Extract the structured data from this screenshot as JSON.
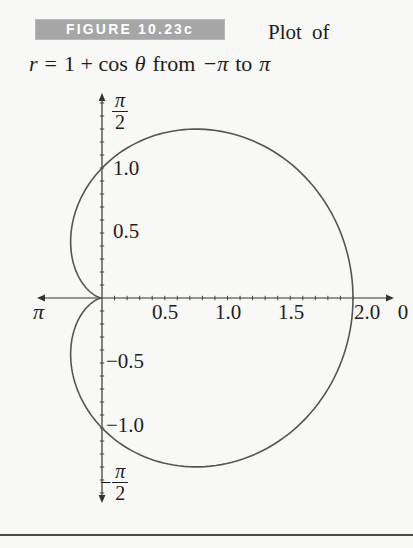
{
  "caption": {
    "badge": "FIGURE 10.23c",
    "after_badge": "Plot of",
    "equation": {
      "lhs": "r",
      "equals": "=",
      "rhs_const": "1 + cos",
      "theta": "θ",
      "word_from": "from",
      "neg_pi": "−π",
      "word_to": "to",
      "pi": "π"
    }
  },
  "plot": {
    "labels": {
      "y_top_num": "π",
      "y_top_den": "2",
      "y_bottom_minus": "−",
      "y_bottom_num": "π",
      "y_bottom_den": "2",
      "x_neg_end": "π",
      "x_pos_end": "0",
      "y_pos_1": "1.0",
      "y_pos_05": "0.5",
      "y_neg_05": "−0.5",
      "y_neg_1": "−1.0",
      "x_05": "0.5",
      "x_1": "1.0",
      "x_15": "1.5",
      "x_2": "2.0"
    },
    "colors": {
      "axis": "#333333",
      "curve": "#555555",
      "text": "#1d1d1d",
      "badge_bg": "#a6a6a6",
      "badge_text": "#ffffff"
    }
  },
  "chart_data": {
    "type": "line",
    "coordinate_system": "polar",
    "title": "Plot of r = 1 + cos θ from −π to π",
    "equation": "r = 1 + cos(θ)",
    "a": 1,
    "b": 1,
    "theta_min": -3.141592653589793,
    "theta_max": 3.141592653589793,
    "x_axis": {
      "labeled_ticks": [
        0.5,
        1.0,
        1.5,
        2.0
      ],
      "minor_tick_step": 0.1,
      "tick_range": [
        0.1,
        2.0
      ],
      "arrow_label_positive": "0",
      "arrow_label_negative": "π"
    },
    "y_axis": {
      "labeled_ticks": [
        -1.0,
        -0.5,
        0.5,
        1.0
      ],
      "minor_tick_step": 0.1,
      "tick_range": [
        -1.5,
        1.5
      ],
      "arrow_label_top": "π/2",
      "arrow_label_bottom": "−π/2"
    },
    "key_points": [
      {
        "theta": 0.0,
        "x": 2.0,
        "y": 0.0
      },
      {
        "theta": 1.0472,
        "x": 0.75,
        "y": 1.299
      },
      {
        "theta": 1.5708,
        "x": 0.0,
        "y": 1.0
      },
      {
        "theta": 2.0944,
        "x": -0.25,
        "y": 0.433
      },
      {
        "theta": 3.1416,
        "x": 0.0,
        "y": 0.0
      },
      {
        "theta": -1.0472,
        "x": 0.75,
        "y": -1.299
      },
      {
        "theta": -1.5708,
        "x": 0.0,
        "y": -1.0
      },
      {
        "theta": -2.0944,
        "x": -0.25,
        "y": -0.433
      }
    ]
  }
}
